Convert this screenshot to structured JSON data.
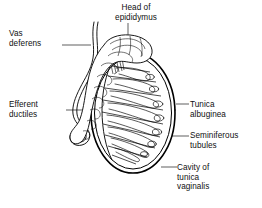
{
  "figure": {
    "background_color": "#ffffff",
    "line_color": "#000000",
    "text_color": "#101010"
  },
  "labels": {
    "vas_deferens": "Vas\ndeferens",
    "efferent_ductiles": "Efferent\nductiles",
    "head_of_epididymus": "Head of\nepididymus",
    "tunica_albuginea": "Tunica\nalbuginea",
    "seminiferous_tubules": "Seminiferous\ntubules",
    "cavity_of_tunica_vaginalis": "Cavity of\ntunica\nvaginalis"
  },
  "caption": {
    "text": "",
    "note": "bottom caption line is cropped off at the image edge and illegible"
  },
  "structures": {
    "testis": "oval body with radiating septa and lobules",
    "epididymis": "convoluted coiled duct along upper left border",
    "vas_deferens": "wavy tube ascending at left",
    "tunica_albuginea": "outer capsule of testis",
    "tunica_vaginalis_cavity": "space outside the capsule"
  }
}
